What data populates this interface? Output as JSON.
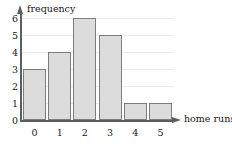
{
  "chart_data": {
    "type": "bar",
    "title": "",
    "subtitle": "",
    "xlabel": "home runs",
    "ylabel": "frequency",
    "categories": [
      "0",
      "1",
      "2",
      "3",
      "4",
      "5"
    ],
    "values": [
      3,
      4,
      6,
      5,
      1,
      1
    ],
    "x_tick_labels": [
      "0",
      "1",
      "2",
      "3",
      "4",
      "5"
    ],
    "y_tick_labels": [
      "0",
      "1",
      "2",
      "3",
      "4",
      "5",
      "6"
    ],
    "xlim": [
      -0.5,
      5.5
    ],
    "ylim": [
      0,
      6
    ],
    "grid": "horizontal",
    "legend": "none",
    "annotations": [],
    "colors": {
      "bar_fill": "#dcdcdc",
      "bar_border": "#7d7d7d",
      "axis": "#5e5e5e",
      "gridline": "#ececed",
      "text": "#171717",
      "background": "#ffffff"
    },
    "axis_arrows": {
      "x": "right-arrow",
      "y": "up-arrow"
    }
  }
}
